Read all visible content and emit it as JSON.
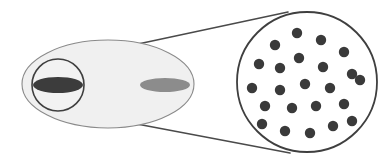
{
  "figure": {
    "title": "Magnified inset diagram of an oval body with a circular detail region",
    "background_color": "#ffffff",
    "canvas": {
      "width": 390,
      "height": 166
    }
  },
  "colors": {
    "outline": "#3f3f3f",
    "thin_outline": "#6e6e6e",
    "body_fill": "#f0f0f0",
    "inset_fill": "#ffffff",
    "dark_ellipse_fill": "#3c3c3c",
    "gray_ellipse_fill": "#8c8c8c",
    "dot_fill": "#3a3a3a",
    "callout_line": "#4a4a4a"
  },
  "shapes": {
    "body_ellipse": {
      "name": "large-oval-body",
      "cx": 108,
      "cy": 84,
      "rx": 86,
      "ry": 44,
      "fill": "#f0f0f0",
      "stroke": "#8a8a8a",
      "stroke_width": 1.1
    },
    "detail_circle": {
      "name": "small-detail-circle",
      "cx": 58,
      "cy": 85,
      "r": 26,
      "fill": "#f2f2f2",
      "stroke": "#3f3f3f",
      "stroke_width": 1.6
    },
    "dark_ellipse": {
      "name": "dark-lens-ellipse",
      "cx": 58,
      "cy": 85,
      "rx": 25,
      "ry": 8,
      "fill": "#3c3c3c"
    },
    "gray_ellipse": {
      "name": "gray-lens-ellipse",
      "cx": 165,
      "cy": 85,
      "rx": 25,
      "ry": 7,
      "fill": "#8c8c8c"
    },
    "magnified_circle": {
      "name": "magnified-detail-circle",
      "cx": 307,
      "cy": 82,
      "r": 70,
      "fill": "#ffffff",
      "stroke": "#3f3f3f",
      "stroke_width": 1.8
    },
    "callout_lines": [
      {
        "name": "callout-line-upper",
        "x1": 63,
        "y1": 60,
        "x2": 288,
        "y2": 12
      },
      {
        "name": "callout-line-lower",
        "x1": 63,
        "y1": 110,
        "x2": 290,
        "y2": 153
      }
    ]
  },
  "chart_data": {
    "type": "scatter",
    "xlabel": "",
    "ylabel": "",
    "count": 23,
    "dot_radius": 5.2,
    "dot_color": "#3a3a3a",
    "region": {
      "shape": "circle",
      "cx": 307,
      "cy": 82,
      "r": 70
    },
    "points": [
      {
        "x": 297,
        "y": 33
      },
      {
        "x": 275,
        "y": 45
      },
      {
        "x": 321,
        "y": 40
      },
      {
        "x": 344,
        "y": 52
      },
      {
        "x": 299,
        "y": 58
      },
      {
        "x": 259,
        "y": 64
      },
      {
        "x": 280,
        "y": 68
      },
      {
        "x": 323,
        "y": 67
      },
      {
        "x": 352,
        "y": 74
      },
      {
        "x": 252,
        "y": 88
      },
      {
        "x": 280,
        "y": 90
      },
      {
        "x": 305,
        "y": 84
      },
      {
        "x": 330,
        "y": 88
      },
      {
        "x": 360,
        "y": 80
      },
      {
        "x": 265,
        "y": 106
      },
      {
        "x": 292,
        "y": 108
      },
      {
        "x": 316,
        "y": 106
      },
      {
        "x": 344,
        "y": 104
      },
      {
        "x": 262,
        "y": 124
      },
      {
        "x": 285,
        "y": 131
      },
      {
        "x": 310,
        "y": 133
      },
      {
        "x": 333,
        "y": 126
      },
      {
        "x": 352,
        "y": 121
      }
    ]
  }
}
